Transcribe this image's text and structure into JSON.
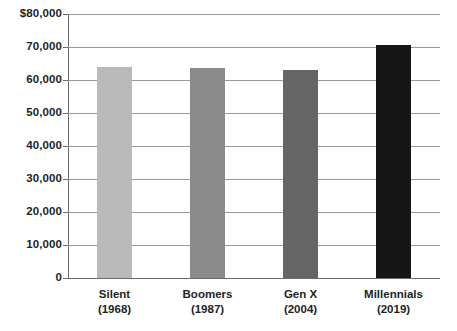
{
  "chart_data": {
    "type": "bar",
    "title": "",
    "subtitle": "",
    "xlabel": "",
    "ylabel": "",
    "ylim": [
      0,
      80000
    ],
    "ytick_step": 10000,
    "grid": true,
    "legend": false,
    "categories": [
      "Silent",
      "Boomers",
      "Gen X",
      "Millennials"
    ],
    "category_sublabels": [
      "(1968)",
      "(1987)",
      "(2004)",
      "(2019)"
    ],
    "values": [
      64000,
      63500,
      63000,
      70500
    ],
    "bar_colors": [
      "#b9b9b9",
      "#8b8b8b",
      "#656565",
      "#161616"
    ],
    "ytick_labels": [
      "$80,000",
      "70,000",
      "60,000",
      "50,000",
      "40,000",
      "30,000",
      "20,000",
      "10,000",
      "0"
    ],
    "ytick_values": [
      80000,
      70000,
      60000,
      50000,
      40000,
      30000,
      20000,
      10000,
      0
    ],
    "axis_color": "#6a6a6a",
    "gridline_color": "#9a9a9a",
    "text_color": "#221f1f",
    "background_color": "#ffffff"
  }
}
